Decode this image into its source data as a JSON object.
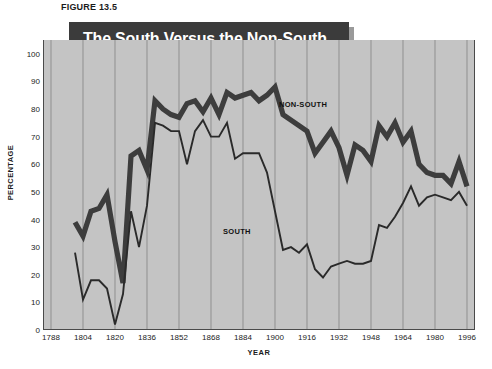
{
  "figure": {
    "number_label": "FIGURE 13.5",
    "title_line1": "The South Versus the Non-South",
    "title_line2": "for Presidential Voter Turnout",
    "source_note": ""
  },
  "colors": {
    "plot_background": "#c4c4c4",
    "banner_background": "#3b3b3b",
    "banner_shadow": "#9a9a9a",
    "banner_text": "#ffffff",
    "gridline": "#8f8f8f",
    "axis": "#4a4a4a",
    "non_south_line": "#3d3d3d",
    "south_line": "#2a2a2a",
    "text": "#1b1b1b",
    "page_background": "#ffffff"
  },
  "axes": {
    "y_title": "PERCENTAGE",
    "x_title": "YEAR",
    "y_ticks": [
      "100",
      "90",
      "80",
      "70",
      "60",
      "50",
      "40",
      "30",
      "20",
      "10",
      "0"
    ],
    "x_ticks": [
      "1788",
      "1804",
      "1820",
      "1836",
      "1852",
      "1868",
      "1884",
      "1900",
      "1916",
      "1932",
      "1948",
      "1964",
      "1980",
      "1996"
    ]
  },
  "annotations": {
    "non_south": "NON-SOUTH",
    "south": "SOUTH"
  },
  "chart_data": {
    "type": "line",
    "title": "The South Versus the Non-South for Presidential Voter Turnout",
    "xlabel": "YEAR",
    "ylabel": "PERCENTAGE",
    "xlim": [
      1784,
      2000
    ],
    "ylim": [
      0,
      105
    ],
    "grid": true,
    "grid_axis": "x",
    "legend": "inline-annotations",
    "x_tick_interval": 16,
    "y_tick_interval": 10,
    "x": [
      1800,
      1804,
      1808,
      1812,
      1816,
      1820,
      1824,
      1828,
      1832,
      1836,
      1840,
      1844,
      1848,
      1852,
      1856,
      1860,
      1864,
      1868,
      1872,
      1876,
      1880,
      1884,
      1888,
      1892,
      1896,
      1900,
      1904,
      1908,
      1912,
      1916,
      1920,
      1924,
      1928,
      1932,
      1936,
      1940,
      1944,
      1948,
      1952,
      1956,
      1960,
      1964,
      1968,
      1972,
      1976,
      1980,
      1984,
      1988,
      1992,
      1996
    ],
    "series": [
      {
        "name": "NON-SOUTH",
        "style": "thick",
        "values": [
          39,
          34,
          43,
          44,
          49,
          32,
          17,
          63,
          65,
          58,
          83,
          80,
          78,
          77,
          82,
          83,
          79,
          84,
          78,
          86,
          84,
          85,
          86,
          83,
          85,
          88,
          78,
          76,
          74,
          72,
          64,
          68,
          72,
          66,
          56,
          67,
          65,
          61,
          74,
          70,
          75,
          68,
          72,
          60,
          57,
          56,
          56,
          53,
          61,
          52
        ]
      },
      {
        "name": "SOUTH",
        "style": "thin",
        "values": [
          28,
          11,
          18,
          18,
          15,
          2,
          13,
          43,
          30,
          45,
          75,
          74,
          72,
          72,
          60,
          72,
          76,
          70,
          70,
          75,
          62,
          64,
          64,
          64,
          57,
          43,
          29,
          30,
          28,
          31,
          22,
          19,
          23,
          24,
          25,
          24,
          24,
          25,
          38,
          37,
          41,
          46,
          52,
          45,
          48,
          49,
          48,
          47,
          50,
          45
        ]
      }
    ]
  }
}
